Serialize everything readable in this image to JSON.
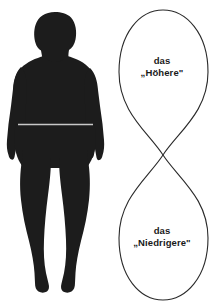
{
  "diagram": {
    "background_color": "#ffffff",
    "ink_color": "#1a1a1a",
    "silhouette": {
      "name": "human-body-silhouette",
      "fill_color": "#1c1c1c",
      "waist_line_color": "#c8c8c8",
      "description": "front-view filled black silhouette of a standing human figure with arms at the sides and a thin light waistline"
    },
    "lemniscate": {
      "name": "infinity-loop-curve",
      "stroke_color": "#2a2a2a",
      "stroke_width": 1,
      "fill": "none",
      "crossing_point": {
        "x": 51,
        "y": 155
      },
      "upper_loop_top_y": 10,
      "lower_loop_bottom_y": 300,
      "left_extent_x": 7,
      "right_extent_x": 100
    },
    "labels": {
      "upper": {
        "line1": "das",
        "line2": "„Höhere\""
      },
      "lower": {
        "line1": "das",
        "line2": "„Niedrigere\""
      }
    }
  }
}
